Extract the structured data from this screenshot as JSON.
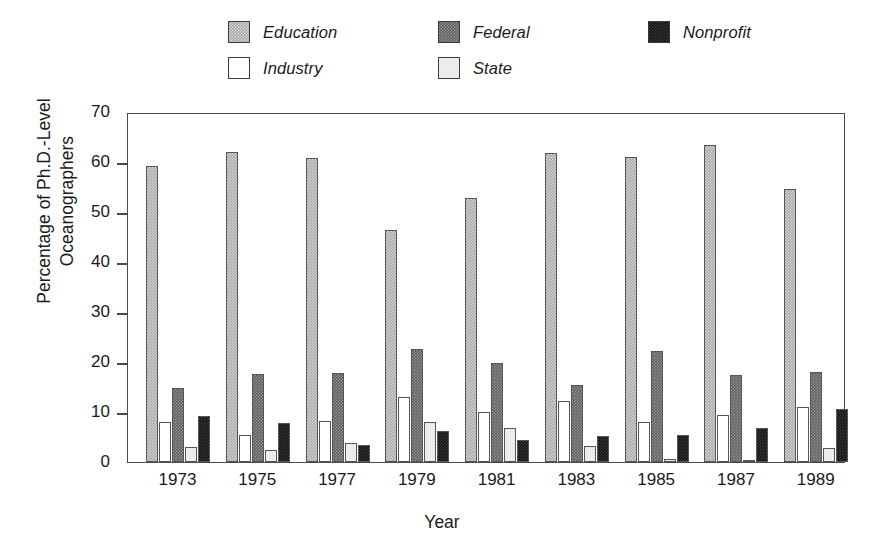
{
  "chart_data": {
    "type": "bar",
    "title": "",
    "xlabel": "Year",
    "ylabel": "Percentage of Ph.D.-Level Oceanographers",
    "ylabel_line1": "Percentage of Ph.D.-Level",
    "ylabel_line2": "Oceanographers",
    "ylim": [
      0,
      70
    ],
    "yticks": [
      0,
      10,
      20,
      30,
      40,
      50,
      60,
      70
    ],
    "grid": false,
    "legend_position": "top",
    "categories": [
      "1973",
      "1975",
      "1977",
      "1979",
      "1981",
      "1983",
      "1985",
      "1987",
      "1989"
    ],
    "series": [
      {
        "name": "Education",
        "color": "#a8a8a8",
        "values": [
          59.3,
          62.0,
          60.8,
          46.5,
          52.8,
          61.8,
          61.0,
          63.5,
          54.7
        ]
      },
      {
        "name": "Industry",
        "color": "#ffffff",
        "values": [
          8.0,
          5.5,
          8.3,
          13.0,
          10.0,
          12.3,
          8.0,
          9.4,
          11.0
        ]
      },
      {
        "name": "Federal",
        "color": "#606060",
        "values": [
          14.9,
          17.7,
          17.9,
          22.6,
          19.9,
          15.4,
          22.2,
          17.4,
          18.0
        ]
      },
      {
        "name": "State",
        "color": "#ececec",
        "values": [
          3.0,
          2.5,
          3.9,
          8.0,
          6.8,
          3.2,
          0.7,
          0.4,
          2.8
        ]
      },
      {
        "name": "Nonprofit",
        "color": "#151515",
        "values": [
          9.3,
          7.8,
          3.4,
          6.3,
          4.4,
          5.2,
          5.4,
          6.8,
          10.6
        ]
      }
    ]
  },
  "legend": {
    "entries": [
      {
        "label": "Education",
        "fill": "fill-education"
      },
      {
        "label": "Federal",
        "fill": "fill-federal"
      },
      {
        "label": "Nonprofit",
        "fill": "fill-nonprofit"
      },
      {
        "label": "Industry",
        "fill": "fill-industry"
      },
      {
        "label": "State",
        "fill": "fill-state"
      }
    ]
  }
}
